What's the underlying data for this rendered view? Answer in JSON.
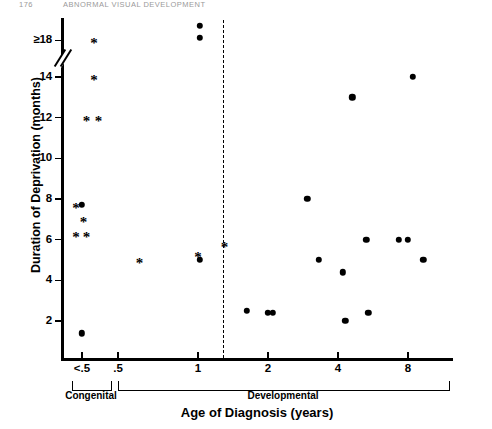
{
  "running_head": {
    "page_number": "176",
    "title": "ABNORMAL VISUAL DEVELOPMENT"
  },
  "chart_data": {
    "type": "scatter",
    "title": "",
    "xlabel": "Age of Diagnosis (years)",
    "ylabel": "Duration of Deprivation (months)",
    "x_scale": "log",
    "y_tick_labels": [
      "≥18",
      "14",
      "12",
      "10",
      "8",
      "6",
      "4",
      "2"
    ],
    "y_tick_values": [
      18,
      14,
      12,
      10,
      8,
      6,
      4,
      2
    ],
    "ylim": [
      0,
      18
    ],
    "y_axis_break_between": [
      14,
      18
    ],
    "x_tick_labels": [
      "<.5",
      ".5",
      "1",
      "2",
      "4",
      "8"
    ],
    "x_tick_values": [
      0.25,
      0.5,
      1,
      2,
      4,
      8
    ],
    "grid": false,
    "legend": "none",
    "divider": {
      "label": "",
      "x_value": 1.45,
      "style": "dashed"
    },
    "groups": [
      {
        "label": "Congenital",
        "x_from": 0.18,
        "x_to": 0.34
      },
      {
        "label": "Developmental",
        "x_from": 0.42,
        "x_to": 11.5
      }
    ],
    "series": [
      {
        "name": "filled-circle",
        "marker": "●",
        "points": [
          {
            "x": 0.25,
            "y": 7.7
          },
          {
            "x": 0.25,
            "y": 1.4
          },
          {
            "x": 1.02,
            "y": 19.2
          },
          {
            "x": 1.02,
            "y": 18.2
          },
          {
            "x": 1.02,
            "y": 5.0
          },
          {
            "x": 1.62,
            "y": 2.5
          },
          {
            "x": 2.0,
            "y": 2.4
          },
          {
            "x": 2.1,
            "y": 2.4
          },
          {
            "x": 2.95,
            "y": 8.0
          },
          {
            "x": 3.3,
            "y": 5.0
          },
          {
            "x": 4.2,
            "y": 4.4
          },
          {
            "x": 4.3,
            "y": 2.0
          },
          {
            "x": 4.6,
            "y": 13.0
          },
          {
            "x": 5.3,
            "y": 6.0
          },
          {
            "x": 5.4,
            "y": 2.4
          },
          {
            "x": 7.3,
            "y": 6.0
          },
          {
            "x": 8.0,
            "y": 6.0
          },
          {
            "x": 8.4,
            "y": 14.0
          },
          {
            "x": 9.3,
            "y": 5.0
          }
        ]
      },
      {
        "name": "asterisk",
        "marker": "*",
        "points": [
          {
            "x": 0.33,
            "y": 18.0
          },
          {
            "x": 0.33,
            "y": 14.0
          },
          {
            "x": 0.28,
            "y": 12.0
          },
          {
            "x": 0.36,
            "y": 12.0
          },
          {
            "x": 0.21,
            "y": 7.7
          },
          {
            "x": 0.26,
            "y": 7.0
          },
          {
            "x": 0.21,
            "y": 6.3
          },
          {
            "x": 0.28,
            "y": 6.3
          },
          {
            "x": 0.56,
            "y": 5.0
          },
          {
            "x": 1.0,
            "y": 5.3
          },
          {
            "x": 1.3,
            "y": 5.8
          }
        ]
      }
    ]
  }
}
